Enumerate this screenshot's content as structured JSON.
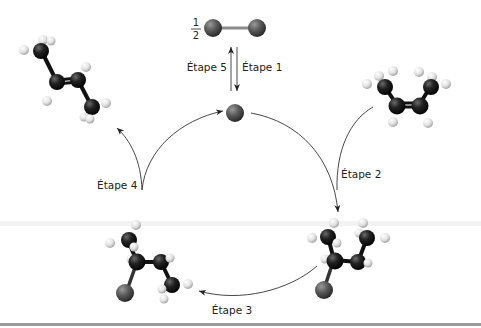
{
  "diagram": {
    "title": "",
    "fraction": {
      "numerator": "1",
      "denominator": "2"
    },
    "steps": [
      {
        "id": 1,
        "label": "Étape 1"
      },
      {
        "id": 2,
        "label": "Étape 2"
      },
      {
        "id": 3,
        "label": "Étape 3"
      },
      {
        "id": 4,
        "label": "Étape 4"
      },
      {
        "id": 5,
        "label": "Étape 5"
      }
    ],
    "species": [
      {
        "name": "dihalogen-molecule",
        "position": "top-center"
      },
      {
        "name": "halogen-radical",
        "position": "center-top"
      },
      {
        "name": "cis-2-butene",
        "position": "top-right"
      },
      {
        "name": "halobutyl-radical-a",
        "position": "bottom-right"
      },
      {
        "name": "halobutyl-radical-b",
        "position": "bottom-left"
      },
      {
        "name": "trans-2-butene",
        "position": "top-left"
      }
    ],
    "colors": {
      "carbon": "#1a1a1a",
      "hydrogen": "#e8e8e8",
      "halogen": "#555555",
      "arrow": "#333333",
      "bottom_rule": "#9a9a9a"
    }
  }
}
